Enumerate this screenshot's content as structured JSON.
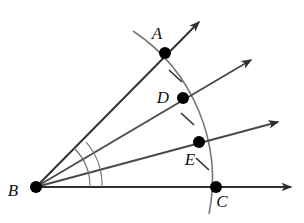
{
  "figure": {
    "kind": "geometry-diagram",
    "background_color": "#ffffff",
    "stroke_color": "#3b3b3b",
    "point_color": "#000000",
    "arc_color": "#6e6e6e",
    "label_color": "#111111",
    "width": 304,
    "height": 223
  },
  "points": [
    {
      "id": "A",
      "label": "A",
      "x": 165,
      "y": 53,
      "label_x": 157,
      "label_y": 39,
      "radius": 6
    },
    {
      "id": "D",
      "label": "D",
      "x": 183,
      "y": 98,
      "label_x": 163,
      "label_y": 103,
      "radius": 6
    },
    {
      "id": "E",
      "label": "E",
      "x": 199,
      "y": 142,
      "label_x": 190,
      "label_y": 165,
      "radius": 6
    },
    {
      "id": "C",
      "label": "C",
      "x": 216,
      "y": 187,
      "label_x": 222,
      "label_y": 207,
      "radius": 6
    },
    {
      "id": "B",
      "label": "B",
      "x": 36,
      "y": 187,
      "label_x": 13,
      "label_y": 196,
      "radius": 6
    }
  ],
  "rays": [
    {
      "id": "ray-BA",
      "from": "B",
      "through": "A",
      "tip_x": 199,
      "tip_y": 22,
      "label": "ray BA"
    },
    {
      "id": "ray-BD",
      "from": "B",
      "through": "D",
      "tip_x": 251,
      "tip_y": 60,
      "label": "ray BD"
    },
    {
      "id": "ray-BE",
      "from": "B",
      "through": "E",
      "tip_x": 278,
      "tip_y": 122,
      "label": "ray BE"
    },
    {
      "id": "ray-BC",
      "from": "B",
      "through": "C",
      "tip_x": 291,
      "tip_y": 187,
      "label": "ray BC"
    }
  ],
  "arc": {
    "id": "arc-ADEC",
    "center": "B",
    "radius": 178,
    "start_x": 133,
    "start_y": 31,
    "end_x": 209,
    "end_y": 214,
    "description": "circular arc centered at B through A, D, E and C"
  },
  "tick_marks": [
    {
      "id": "tick-AD",
      "between": "A-D",
      "x": 175,
      "y": 76,
      "angle": -28
    },
    {
      "id": "tick-DE",
      "between": "D-E",
      "x": 187,
      "y": 119,
      "angle": -18
    },
    {
      "id": "tick-EC",
      "between": "E-C",
      "x": 202,
      "y": 164,
      "angle": -8
    }
  ],
  "angle_arcs": [
    {
      "id": "angle-arc-ABC",
      "vertex": "B",
      "radius": 54,
      "from_ray": "ray-BC",
      "to_ray": "ray-BA"
    },
    {
      "id": "angle-arc-DBC",
      "vertex": "B",
      "radius": 66,
      "from_ray": "ray-BC",
      "to_ray": "ray-BD"
    }
  ],
  "caption": {
    "vertex_label": "B",
    "points_order": "A, D, E, C"
  }
}
